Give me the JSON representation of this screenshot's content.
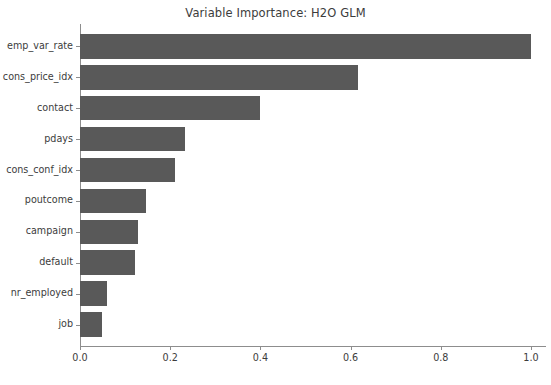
{
  "chart_data": {
    "type": "bar",
    "orientation": "horizontal",
    "title": "Variable Importance: H2O GLM",
    "xlabel": "",
    "ylabel": "",
    "categories": [
      "emp_var_rate",
      "cons_price_idx",
      "contact",
      "pdays",
      "cons_conf_idx",
      "poutcome",
      "campaign",
      "default",
      "nr_employed",
      "job"
    ],
    "values": [
      1.0,
      0.617,
      0.399,
      0.232,
      0.211,
      0.146,
      0.128,
      0.123,
      0.059,
      0.048
    ],
    "xlim": [
      0.0,
      1.03
    ],
    "xticks": [
      0.0,
      0.2,
      0.4,
      0.6,
      0.8,
      1.0
    ],
    "xticklabels": [
      "0.0",
      "0.2",
      "0.4",
      "0.6",
      "0.8",
      "1.0"
    ],
    "grid": false,
    "legend": false,
    "bar_color": "#595959",
    "axis_color": "#8d8d8d",
    "text_color": "#3c3c3c",
    "background": "#ffffff"
  },
  "caption": {
    "text": ""
  }
}
